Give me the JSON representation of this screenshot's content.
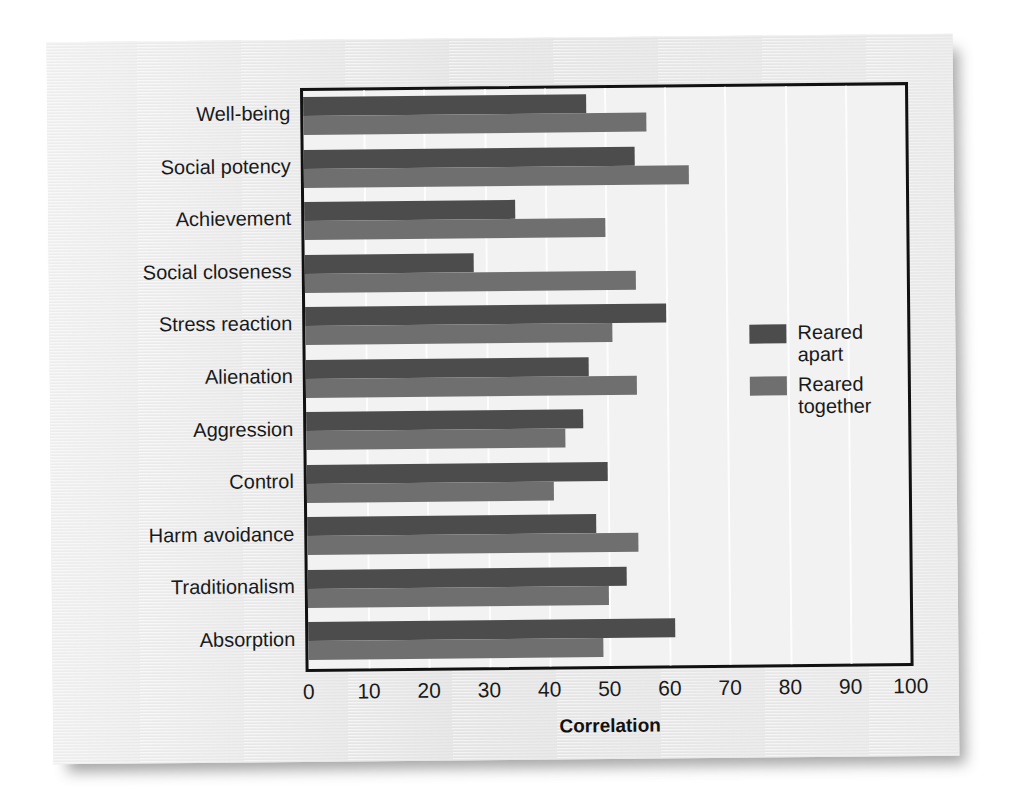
{
  "chart_data": {
    "type": "bar",
    "orientation": "horizontal",
    "title": "",
    "xlabel": "Correlation",
    "ylabel": "",
    "xlim": [
      0,
      100
    ],
    "xticks": [
      0,
      10,
      20,
      30,
      40,
      50,
      60,
      70,
      80,
      90,
      100
    ],
    "grid": true,
    "legend_position": "inside-right",
    "categories": [
      "Well-being",
      "Social potency",
      "Achievement",
      "Social closeness",
      "Stress reaction",
      "Alienation",
      "Aggression",
      "Control",
      "Harm avoidance",
      "Traditionalism",
      "Absorption"
    ],
    "series": [
      {
        "name": "Reared apart",
        "color": "#4c4c4c",
        "values": [
          47,
          55,
          35,
          28,
          60,
          47,
          46,
          50,
          48,
          53,
          61
        ]
      },
      {
        "name": "Reared together",
        "color": "#6f6f6f",
        "values": [
          57,
          64,
          50,
          55,
          51,
          55,
          43,
          41,
          55,
          50,
          49
        ]
      }
    ]
  },
  "legend": {
    "items": [
      {
        "label_line1": "Reared",
        "label_line2": "apart",
        "color": "#4c4c4c"
      },
      {
        "label_line1": "Reared",
        "label_line2": "together",
        "color": "#6f6f6f"
      }
    ]
  },
  "axis": {
    "x_title": "Correlation"
  }
}
